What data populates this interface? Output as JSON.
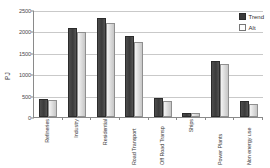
{
  "chart_data": {
    "type": "bar",
    "title": "",
    "xlabel": "",
    "ylabel": "PJ",
    "ylim": [
      0,
      2500
    ],
    "yticks": [
      0,
      500,
      1000,
      1500,
      2000,
      2500
    ],
    "ytick_labels": [
      "0",
      "500",
      "1000",
      "1500",
      "2000",
      "2500"
    ],
    "grid": true,
    "legend_position": "top-right",
    "categories": [
      "Refineries",
      "Industry",
      "Residential",
      "Road Transport",
      "Off Road Transp",
      "Ships",
      "Power Plants",
      "Non energy use"
    ],
    "series": [
      {
        "name": "Trend",
        "color": "#3a3a3a",
        "values": [
          420,
          2080,
          2320,
          1900,
          450,
          100,
          1320,
          380
        ]
      },
      {
        "name": "Alt",
        "color": "#d8d8d8",
        "values": [
          405,
          1990,
          2200,
          1760,
          375,
          90,
          1230,
          300
        ]
      }
    ]
  },
  "legend": {
    "items": [
      {
        "label": "Trend"
      },
      {
        "label": "Alt"
      }
    ]
  },
  "colors": {
    "trend": "#3a3a3a",
    "alt": "#d8d8d8",
    "axis": "#8a8a8a",
    "grid": "#c9c9c9"
  }
}
